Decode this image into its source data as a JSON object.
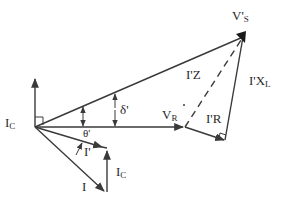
{
  "diagram": {
    "type": "phasor-diagram",
    "stroke_color": "#3a3a3a",
    "background": "#ffffff",
    "labels": {
      "vs": {
        "main": "V'",
        "sub": "S"
      },
      "ic_left": {
        "main": "I",
        "sub": "C"
      },
      "delta": "δ'",
      "vr": {
        "main": "V",
        "sub": "R"
      },
      "irr": "I'R",
      "theta": "θ'",
      "iprime": "I'",
      "ic_bottom": {
        "main": "I",
        "sub": "C"
      },
      "i": "I",
      "iz": "I'Z",
      "ixl": {
        "main": "I'X",
        "sub": "L"
      }
    },
    "phasors": [
      {
        "name": "V'S",
        "from": [
          35,
          127
        ],
        "to": [
          243,
          37
        ]
      },
      {
        "name": "VR",
        "from": [
          35,
          127
        ],
        "to": [
          185,
          127
        ]
      },
      {
        "name": "I'R",
        "from": [
          185,
          127
        ],
        "to": [
          225,
          140
        ]
      },
      {
        "name": "I'XL",
        "from": [
          225,
          140
        ],
        "to": [
          243,
          37
        ]
      },
      {
        "name": "I'Z",
        "from": [
          185,
          127
        ],
        "to": [
          243,
          37
        ],
        "style": "dashed"
      },
      {
        "name": "IC (reference)",
        "from": [
          35,
          127
        ],
        "to": [
          35,
          78
        ]
      },
      {
        "name": "I'",
        "from": [
          35,
          127
        ],
        "to": [
          103,
          147
        ]
      },
      {
        "name": "IC",
        "from": [
          107,
          192
        ],
        "to": [
          107,
          150
        ]
      },
      {
        "name": "I",
        "from": [
          35,
          127
        ],
        "to": [
          105,
          192
        ]
      }
    ]
  }
}
